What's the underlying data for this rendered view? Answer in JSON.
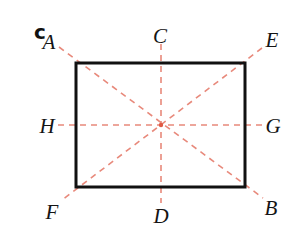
{
  "figure": {
    "panel_letter": "c",
    "background_color": "#ffffff",
    "rectangle": {
      "stroke_color": "#111111",
      "stroke_width": 3,
      "x": 76,
      "y": 63,
      "width": 169,
      "height": 124
    },
    "dashed_lines": {
      "color": "#e8897b",
      "stroke_width": 1.6,
      "dash_pattern": "6 5"
    },
    "center_point": {
      "x": 161,
      "y": 125,
      "color": "#e05a44",
      "radius": 2.2
    },
    "axes": [
      {
        "name": "diagonal-A-B",
        "x1": 59,
        "y1": 47,
        "x2": 263,
        "y2": 198
      },
      {
        "name": "diagonal-E-F",
        "x1": 262,
        "y1": 48,
        "x2": 62,
        "y2": 200
      },
      {
        "name": "vertical-C-D",
        "x1": 161,
        "y1": 44,
        "x2": 161,
        "y2": 203
      },
      {
        "name": "horizontal-H-G",
        "x1": 58,
        "y1": 125,
        "x2": 264,
        "y2": 125
      }
    ],
    "labels": [
      {
        "id": "A",
        "text": "A",
        "x": 49,
        "y": 42
      },
      {
        "id": "C",
        "text": "C",
        "x": 160,
        "y": 36
      },
      {
        "id": "E",
        "text": "E",
        "x": 272,
        "y": 40
      },
      {
        "id": "H",
        "text": "H",
        "x": 47,
        "y": 126
      },
      {
        "id": "G",
        "text": "G",
        "x": 273,
        "y": 126
      },
      {
        "id": "F",
        "text": "F",
        "x": 52,
        "y": 212
      },
      {
        "id": "D",
        "text": "D",
        "x": 161,
        "y": 216
      },
      {
        "id": "B",
        "text": "B",
        "x": 271,
        "y": 208
      }
    ]
  }
}
